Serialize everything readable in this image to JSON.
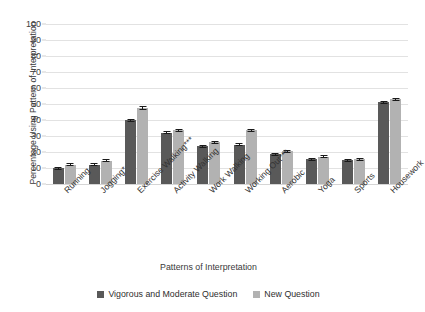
{
  "chart_data": {
    "type": "bar",
    "title": "",
    "xlabel": "Patterns of Interpretation",
    "ylabel": "Percentage Using Pattern of Interpretation",
    "ylim": [
      0,
      100
    ],
    "yticks": [
      0,
      10,
      20,
      30,
      40,
      50,
      60,
      70,
      80,
      90,
      100
    ],
    "grid": true,
    "legend_position": "bottom",
    "orientation": "vertical",
    "categories": [
      "Running",
      "Jogging*",
      "Exercise Walking***",
      "Activity Walking",
      "Work Walking",
      "Working Out***",
      "Aerobic",
      "Yoga",
      "Sports",
      "Housework"
    ],
    "series": [
      {
        "name": "Vigorous and Moderate Question",
        "color": "#595959",
        "values": [
          10,
          12,
          40,
          32,
          23.5,
          24.5,
          18.5,
          15.5,
          15,
          51
        ],
        "errors": [
          0.8,
          0.8,
          0.9,
          0.9,
          0.9,
          0.9,
          0.9,
          0.8,
          0.8,
          0.9
        ]
      },
      {
        "name": "New Question",
        "color": "#b2b2b2",
        "values": [
          12,
          14.5,
          47.5,
          33.5,
          26,
          33.5,
          20.5,
          17,
          15.5,
          53
        ],
        "errors": [
          0.8,
          0.8,
          1.2,
          1.0,
          1.0,
          1.0,
          0.9,
          0.9,
          0.8,
          1.0
        ]
      }
    ]
  },
  "axes": {
    "y_title": "Percentage Using Pattern of Interpretation",
    "x_title": "Patterns of Interpretation"
  }
}
